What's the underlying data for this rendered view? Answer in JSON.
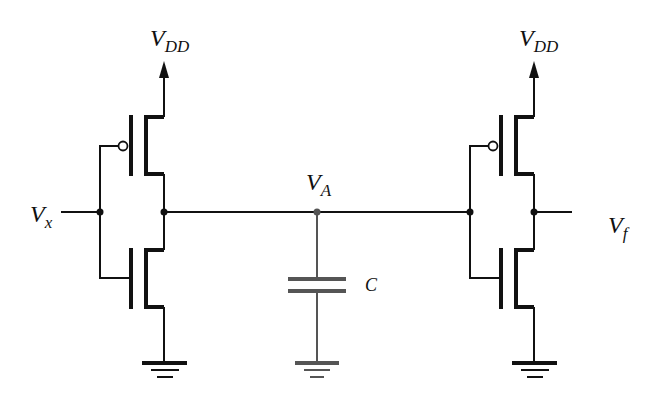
{
  "diagram": {
    "title": "",
    "type": "circuit-schematic",
    "colors": {
      "wire": "#111111",
      "capacitor": "#555555",
      "background": "#ffffff"
    },
    "labels": {
      "vdd_left": {
        "main": "V",
        "sub": "DD"
      },
      "vdd_right": {
        "main": "V",
        "sub": "DD"
      },
      "input": {
        "main": "V",
        "sub": "x"
      },
      "node_a": {
        "main": "V",
        "sub": "A"
      },
      "output": {
        "main": "V",
        "sub": "f"
      },
      "capacitor": "C"
    },
    "components": [
      {
        "id": "inverter-1",
        "type": "CMOS inverter",
        "input": "V_x",
        "output": "V_A",
        "transistors": [
          "PMOS (to V_DD)",
          "NMOS (to ground)"
        ]
      },
      {
        "id": "capacitor",
        "type": "capacitor",
        "label": "C",
        "from": "V_A",
        "to": "ground"
      },
      {
        "id": "inverter-2",
        "type": "CMOS inverter",
        "input": "V_A",
        "output": "V_f",
        "transistors": [
          "PMOS (to V_DD)",
          "NMOS (to ground)"
        ]
      }
    ],
    "nodes": [
      "V_x",
      "V_A",
      "V_f",
      "V_DD",
      "ground"
    ]
  }
}
